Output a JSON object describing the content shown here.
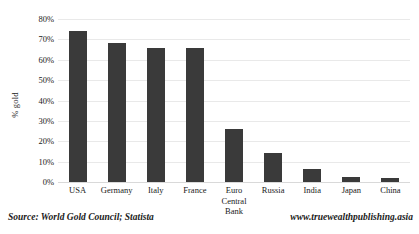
{
  "chart_data": {
    "type": "bar",
    "title": "",
    "xlabel": "",
    "ylabel": "% gold",
    "ylim": [
      0,
      80
    ],
    "grid": true,
    "legend": false,
    "bar_color": "#3a3a3a",
    "categories": [
      "USA",
      "Germany",
      "Italy",
      "France",
      "Euro Central Bank",
      "Russia",
      "India",
      "Japan",
      "China"
    ],
    "category_label_lines": [
      [
        "USA"
      ],
      [
        "Germany"
      ],
      [
        "Italy"
      ],
      [
        "France"
      ],
      [
        "Euro",
        "Central",
        "Bank"
      ],
      [
        "Russia"
      ],
      [
        "India"
      ],
      [
        "Japan"
      ],
      [
        "China"
      ]
    ],
    "values": [
      74,
      68,
      66,
      66,
      26,
      14,
      6.5,
      2.5,
      2
    ],
    "ytick_labels": [
      "80%",
      "70%",
      "60%",
      "50%",
      "40%",
      "30%",
      "20%",
      "10%",
      "0%"
    ],
    "ytick_values": [
      80,
      70,
      60,
      50,
      40,
      30,
      20,
      10,
      0
    ]
  },
  "footer": {
    "source": "Source: World Gold Council; Statista",
    "website": "www.truewealthpublishing.asia"
  }
}
